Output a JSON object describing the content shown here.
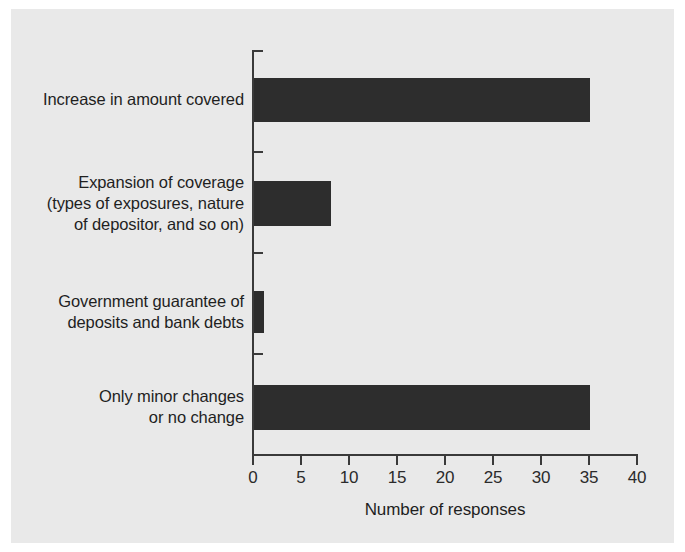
{
  "chart_data": {
    "type": "bar",
    "orientation": "horizontal",
    "title": "",
    "xlabel": "Number of responses",
    "ylabel": "",
    "xlim": [
      0,
      40
    ],
    "xticks": [
      0,
      5,
      10,
      15,
      20,
      25,
      30,
      35,
      40
    ],
    "xtick_labels": [
      "0",
      "5",
      "10",
      "15",
      "20",
      "25",
      "30",
      "35",
      "40"
    ],
    "grid": false,
    "legend": false,
    "bar_color": "#2d2d2d",
    "background_color": "#e9e9e9",
    "axis_color": "#3a3a3a",
    "categories": [
      "Increase in amount covered",
      "Expansion of coverage\n(types of exposures, nature\nof depositor, and so on)",
      "Government guarantee of\ndeposits and bank debts",
      "Only minor changes\nor no change"
    ],
    "values": [
      35,
      8,
      1,
      35
    ]
  }
}
